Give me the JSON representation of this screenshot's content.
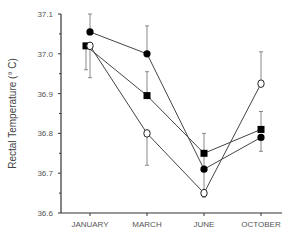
{
  "chart_data": {
    "type": "line",
    "title": "",
    "xlabel": "",
    "ylabel": "Rectal Temperature (° C)",
    "categories": [
      "JANUARY",
      "MARCH",
      "JUNE",
      "OCTOBER"
    ],
    "ylim": [
      36.6,
      37.1
    ],
    "yticks": [
      "36.6",
      "36.7",
      "36.8",
      "36.9",
      "37.0",
      "37.1"
    ],
    "grid": false,
    "legend": null,
    "series": [
      {
        "name": "filled-circle",
        "marker": "filled-circle",
        "values": [
          37.055,
          37.0,
          36.71,
          36.79
        ],
        "err_upper": [
          37.1,
          37.07,
          36.71,
          36.79
        ],
        "err_lower": [
          37.055,
          37.0,
          36.71,
          36.755
        ]
      },
      {
        "name": "filled-square",
        "marker": "filled-square",
        "values": [
          37.02,
          36.895,
          36.75,
          36.81
        ],
        "err_upper": [
          37.02,
          36.955,
          36.8,
          36.855
        ],
        "err_lower": [
          36.96,
          36.895,
          36.64,
          36.81
        ]
      },
      {
        "name": "open-circle",
        "marker": "open-circle",
        "values": [
          37.02,
          36.8,
          36.65,
          36.925
        ],
        "err_upper": [
          37.02,
          36.8,
          36.65,
          37.005
        ],
        "err_lower": [
          36.94,
          36.72,
          36.65,
          36.925
        ]
      }
    ]
  }
}
